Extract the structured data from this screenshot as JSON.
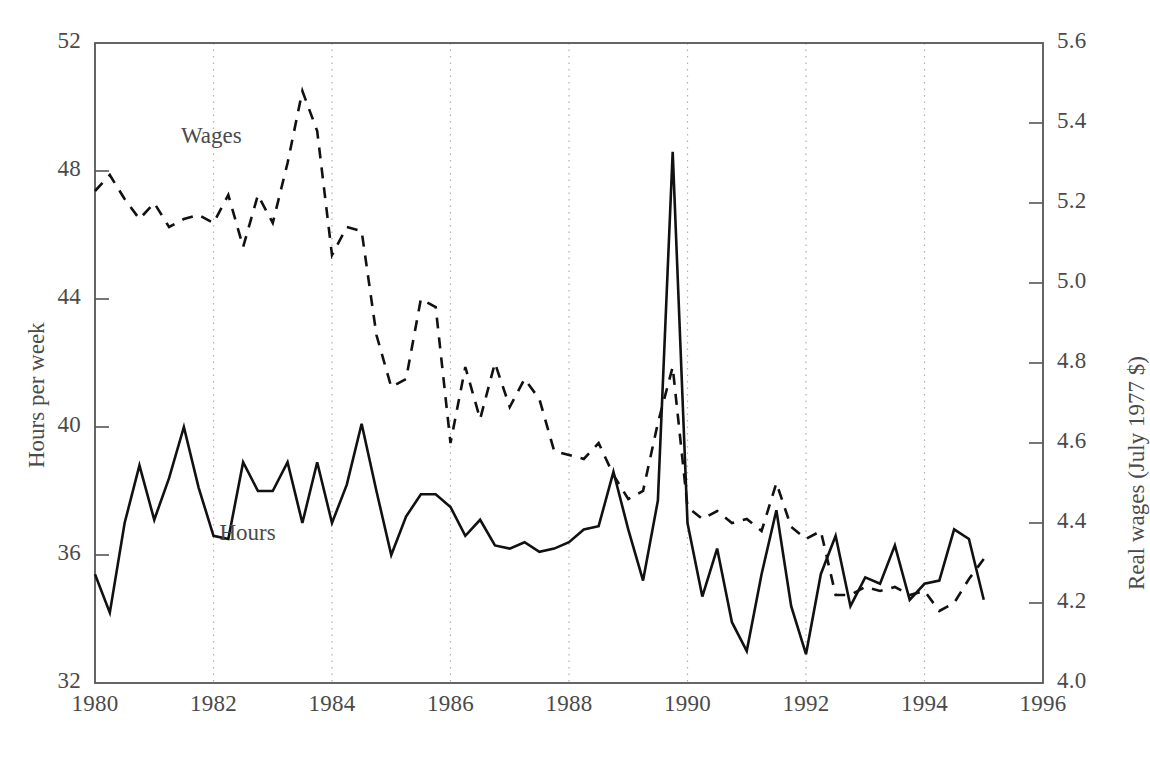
{
  "chart_data": {
    "type": "line",
    "title": "",
    "subtitle": "",
    "xlabel": "",
    "ylabel": "Hours per week",
    "ylabel_right": "Real wages (July 1977 $)",
    "grid": "vertical-dotted-at-even-years",
    "legend_position": "inline-annotations",
    "xlim": [
      1980,
      1996
    ],
    "xticks": [
      "1980",
      "1982",
      "1984",
      "1986",
      "1988",
      "1990",
      "1992",
      "1994",
      "1996"
    ],
    "xtick_values": [
      1980,
      1982,
      1984,
      1986,
      1988,
      1990,
      1992,
      1994,
      1996
    ],
    "ylim": [
      32,
      52
    ],
    "yticks": [
      "32",
      "36",
      "40",
      "44",
      "48",
      "52"
    ],
    "ytick_values": [
      32,
      36,
      40,
      44,
      48,
      52
    ],
    "ylim_right": [
      4.0,
      5.6
    ],
    "yticks_right": [
      "4.0",
      "4.2",
      "4.4",
      "4.6",
      "4.8",
      "5.0",
      "5.2",
      "5.4",
      "5.6"
    ],
    "ytick_values_right": [
      4.0,
      4.2,
      4.4,
      4.6,
      4.8,
      5.0,
      5.2,
      5.4,
      5.6
    ],
    "annotations": [
      {
        "text": "Wages",
        "x": 1981.45,
        "y_axis": "right",
        "y": 5.36
      },
      {
        "text": "Hours",
        "x": 1982.1,
        "y_axis": "left",
        "y": 36.6
      }
    ],
    "series": [
      {
        "name": "Hours",
        "axis": "left",
        "units": "Hours per week",
        "style": "solid",
        "color": "#111111",
        "x": [
          1980.0,
          1980.25,
          1980.5,
          1980.75,
          1981.0,
          1981.25,
          1981.5,
          1981.75,
          1982.0,
          1982.25,
          1982.5,
          1982.75,
          1983.0,
          1983.25,
          1983.5,
          1983.75,
          1984.0,
          1984.25,
          1984.5,
          1984.75,
          1985.0,
          1985.25,
          1985.5,
          1985.75,
          1986.0,
          1986.25,
          1986.5,
          1986.75,
          1987.0,
          1987.25,
          1987.5,
          1987.75,
          1988.0,
          1988.25,
          1988.5,
          1988.75,
          1989.0,
          1989.25,
          1989.5,
          1989.75,
          1990.0,
          1990.25,
          1990.5,
          1990.75,
          1991.0,
          1991.25,
          1991.5,
          1991.75,
          1992.0,
          1992.25,
          1992.5,
          1992.75,
          1993.0,
          1993.25,
          1993.5,
          1993.75,
          1994.0,
          1994.25,
          1994.5,
          1994.75,
          1995.0
        ],
        "values": [
          35.4,
          34.2,
          37.0,
          38.8,
          37.1,
          38.4,
          40.0,
          38.1,
          36.6,
          36.5,
          38.9,
          38.0,
          38.0,
          38.9,
          37.0,
          38.9,
          37.0,
          38.2,
          40.1,
          38.0,
          36.0,
          37.2,
          37.9,
          37.9,
          37.5,
          36.6,
          37.1,
          36.3,
          36.2,
          36.4,
          36.1,
          36.2,
          36.4,
          36.8,
          36.9,
          38.6,
          36.8,
          35.2,
          37.7,
          48.6,
          37.0,
          34.7,
          36.2,
          33.9,
          33.0,
          35.4,
          37.4,
          34.4,
          32.9,
          35.4,
          36.6,
          34.4,
          35.3,
          35.1,
          36.3,
          34.6,
          35.1,
          35.2,
          36.8,
          36.5,
          34.6
        ]
      },
      {
        "name": "Wages",
        "axis": "right",
        "units": "Real wages (July 1977 $)",
        "style": "dashed",
        "color": "#111111",
        "x": [
          1980.0,
          1980.25,
          1980.5,
          1980.75,
          1981.0,
          1981.25,
          1981.5,
          1981.75,
          1982.0,
          1982.25,
          1982.5,
          1982.75,
          1983.0,
          1983.25,
          1983.5,
          1983.75,
          1984.0,
          1984.25,
          1984.5,
          1984.75,
          1985.0,
          1985.25,
          1985.5,
          1985.75,
          1986.0,
          1986.25,
          1986.5,
          1986.75,
          1987.0,
          1987.25,
          1987.5,
          1987.75,
          1988.0,
          1988.25,
          1988.5,
          1988.75,
          1989.0,
          1989.25,
          1989.5,
          1989.75,
          1990.0,
          1990.25,
          1990.5,
          1990.75,
          1991.0,
          1991.25,
          1991.5,
          1991.75,
          1992.0,
          1992.25,
          1992.5,
          1992.75,
          1993.0,
          1993.25,
          1993.5,
          1993.75,
          1994.0,
          1994.25,
          1994.5,
          1994.75,
          1995.0
        ],
        "values": [
          5.23,
          5.27,
          5.21,
          5.16,
          5.2,
          5.14,
          5.16,
          5.17,
          5.15,
          5.22,
          5.09,
          5.22,
          5.15,
          5.3,
          5.48,
          5.38,
          5.07,
          5.14,
          5.13,
          4.87,
          4.74,
          4.76,
          4.96,
          4.94,
          4.6,
          4.79,
          4.66,
          4.8,
          4.69,
          4.76,
          4.71,
          4.58,
          4.57,
          4.56,
          4.6,
          4.52,
          4.46,
          4.48,
          4.65,
          4.79,
          4.44,
          4.41,
          4.43,
          4.4,
          4.41,
          4.38,
          4.5,
          4.39,
          4.36,
          4.38,
          4.22,
          4.22,
          4.24,
          4.23,
          4.24,
          4.22,
          4.23,
          4.18,
          4.2,
          4.26,
          4.31
        ]
      }
    ]
  },
  "axes": {
    "left_title": "Hours per week",
    "right_title": "Real wages (July 1977 $)"
  }
}
